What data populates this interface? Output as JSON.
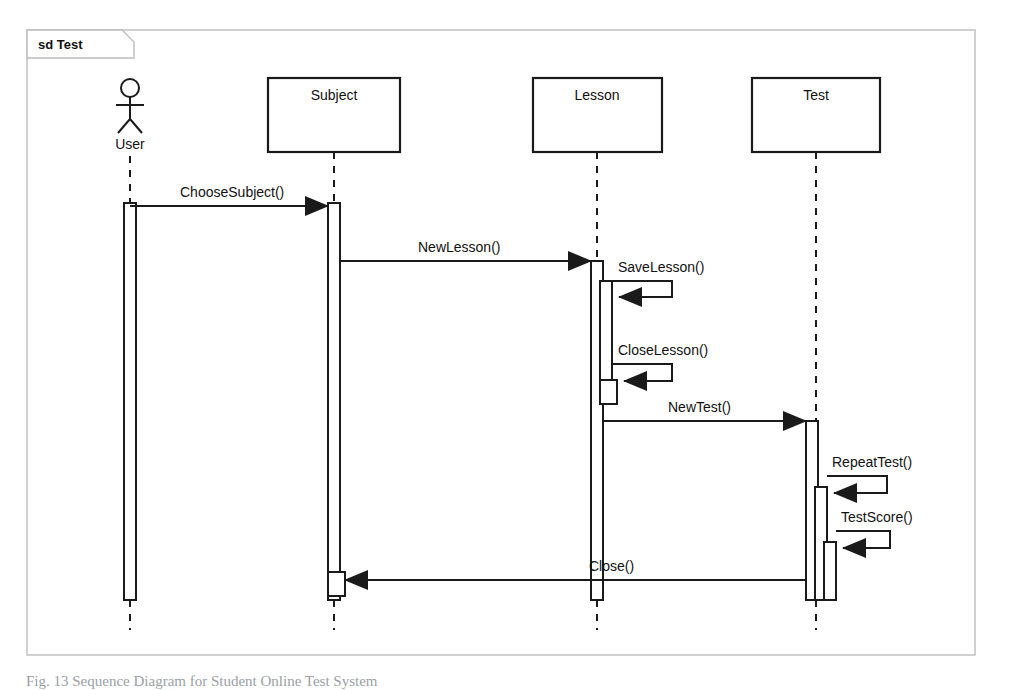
{
  "diagram": {
    "kind": "uml-sequence-diagram",
    "frame": {
      "label_keyword": "sd",
      "label_name": "Test",
      "label_full": "sd Test",
      "x": 27,
      "y": 30,
      "width": 948,
      "height": 625
    },
    "colors": {
      "stroke": "#1a1a1a",
      "background": "#ffffff",
      "text": "#111111",
      "caption": "#9aa0a6"
    },
    "actors": [
      {
        "id": "user",
        "name": "User",
        "type": "actor",
        "x": 130,
        "label_y": 140,
        "head_cy": 88,
        "head_r": 9
      }
    ],
    "lifelines": [
      {
        "id": "subject",
        "name": "Subject",
        "type": "object",
        "x": 334,
        "box_x": 268,
        "box_y": 78,
        "box_w": 132,
        "box_h": 74
      },
      {
        "id": "lesson",
        "name": "Lesson",
        "type": "object",
        "x": 597,
        "box_x": 533,
        "box_y": 78,
        "box_w": 129,
        "box_h": 74
      },
      {
        "id": "test",
        "name": "Test",
        "type": "object",
        "x": 816,
        "box_x": 752,
        "box_y": 78,
        "box_w": 128,
        "box_h": 74
      }
    ],
    "activations": [
      {
        "id": "act-user",
        "lifeline": "user",
        "x": 124,
        "y": 203,
        "width": 12,
        "height": 397,
        "level": 0
      },
      {
        "id": "act-subject",
        "lifeline": "subject",
        "x": 328,
        "y": 203,
        "width": 12,
        "height": 397,
        "level": 0
      },
      {
        "id": "act-subject-close",
        "lifeline": "subject",
        "x": 328,
        "y": 572,
        "width": 17,
        "height": 24,
        "level": 1
      },
      {
        "id": "act-lesson",
        "lifeline": "lesson",
        "x": 591,
        "y": 261,
        "width": 12,
        "height": 339,
        "level": 0
      },
      {
        "id": "act-lesson-save",
        "lifeline": "lesson",
        "x": 600,
        "y": 281,
        "width": 12,
        "height": 117,
        "level": 1
      },
      {
        "id": "act-lesson-close",
        "lifeline": "lesson",
        "x": 600,
        "y": 380,
        "width": 17,
        "height": 24,
        "level": 2
      },
      {
        "id": "act-test",
        "lifeline": "test",
        "x": 806,
        "y": 421,
        "width": 12,
        "height": 179,
        "level": 0
      },
      {
        "id": "act-test-repeat",
        "lifeline": "test",
        "x": 815,
        "y": 487,
        "width": 12,
        "height": 113,
        "level": 1
      },
      {
        "id": "act-test-score",
        "lifeline": "test",
        "x": 824,
        "y": 542,
        "width": 12,
        "height": 58,
        "level": 2
      }
    ],
    "messages": [
      {
        "id": "msg-1",
        "label": "ChooseSubject()",
        "from": "user",
        "to": "subject",
        "kind": "call",
        "self": false,
        "y": 206,
        "x1": 130,
        "x2": 328,
        "label_x": 180,
        "label_y": 197
      },
      {
        "id": "msg-2",
        "label": "NewLesson()",
        "from": "subject",
        "to": "lesson",
        "kind": "call",
        "self": false,
        "y": 261,
        "x1": 340,
        "x2": 591,
        "label_x": 418,
        "label_y": 252
      },
      {
        "id": "msg-3",
        "label": "SaveLesson()",
        "from": "lesson",
        "to": "lesson",
        "kind": "self-call",
        "self": true,
        "y": 281,
        "y_return": 297,
        "x_start": 612,
        "x_out": 672,
        "label_x": 618,
        "label_y": 272
      },
      {
        "id": "msg-4",
        "label": "CloseLesson()",
        "from": "lesson",
        "to": "lesson",
        "kind": "self-call",
        "self": true,
        "y": 364,
        "y_return": 381,
        "x_start": 612,
        "x_out": 672,
        "label_x": 618,
        "label_y": 355
      },
      {
        "id": "msg-5",
        "label": "NewTest()",
        "from": "lesson",
        "to": "test",
        "kind": "call",
        "self": false,
        "y": 421,
        "x1": 604,
        "x2": 806,
        "label_x": 668,
        "label_y": 412
      },
      {
        "id": "msg-6",
        "label": "RepeatTest()",
        "from": "test",
        "to": "test",
        "kind": "self-call",
        "self": true,
        "y": 476,
        "y_return": 493,
        "x_start": 827,
        "x_out": 887,
        "label_x": 832,
        "label_y": 467
      },
      {
        "id": "msg-7",
        "label": "TestScore()",
        "from": "test",
        "to": "test",
        "kind": "self-call",
        "self": true,
        "y": 531,
        "y_return": 548,
        "x_start": 836,
        "x_out": 890,
        "label_x": 841,
        "label_y": 522
      },
      {
        "id": "msg-8",
        "label": "Close()",
        "from": "test",
        "to": "subject",
        "kind": "call",
        "self": false,
        "y": 580,
        "x1": 806,
        "x2": 345,
        "label_x": 589,
        "label_y": 571
      }
    ],
    "caption": {
      "text": "Fig. 13 Sequence Diagram for Student Online Test System",
      "visible_fragment": true
    }
  }
}
